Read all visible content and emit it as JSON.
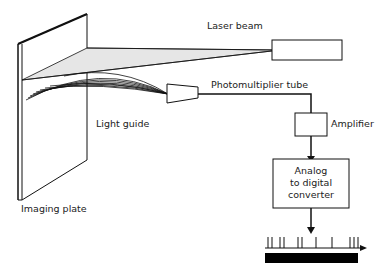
{
  "diagram": {
    "labels": {
      "laser_beam": "Laser beam",
      "photomultiplier_tube": "Photomultiplier tube",
      "light_guide": "Light guide",
      "amplifier": "Amplifier",
      "adc_line1": "Analog",
      "adc_line2": "to digital",
      "adc_line3": "converter",
      "imaging_plate": "Imaging plate"
    },
    "colors": {
      "stroke": "#111111",
      "beam_fill": "#e6e6e6",
      "signal_bar": "#000000"
    },
    "signal_pulses_x": [
      268,
      272,
      280,
      284,
      298,
      302,
      316,
      332,
      350,
      354,
      358
    ]
  }
}
